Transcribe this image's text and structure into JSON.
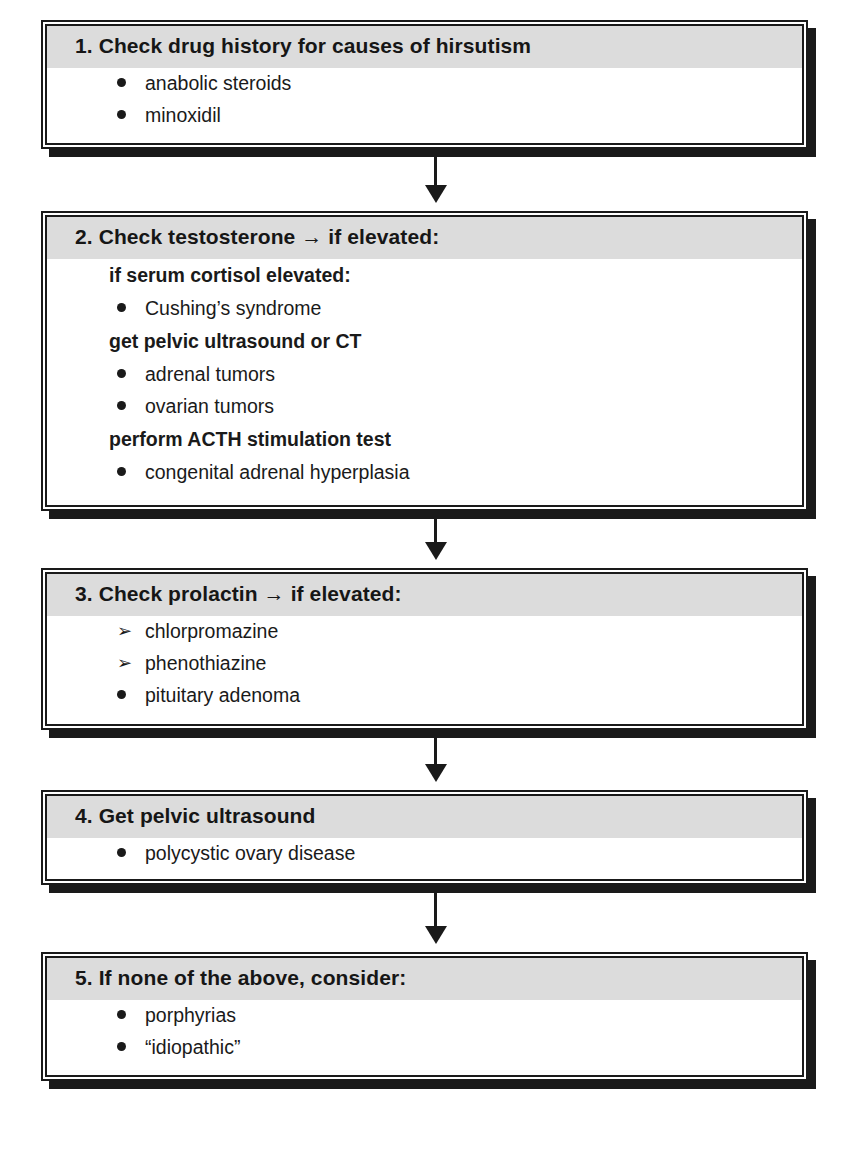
{
  "diagram": {
    "type": "flowchart",
    "steps": [
      {
        "title": "1. Check drug history for causes of hirsutism",
        "lines": [
          {
            "kind": "item",
            "marker": "bullet",
            "text": "anabolic steroids"
          },
          {
            "kind": "item",
            "marker": "bullet",
            "text": "minoxidil"
          }
        ]
      },
      {
        "title": "2. Check testosterone → if elevated:",
        "lines": [
          {
            "kind": "sub",
            "text": "if serum cortisol elevated:"
          },
          {
            "kind": "item",
            "marker": "bullet",
            "text": "Cushing’s syndrome"
          },
          {
            "kind": "sub",
            "text": "get pelvic ultrasound or CT"
          },
          {
            "kind": "item",
            "marker": "bullet",
            "text": "adrenal tumors"
          },
          {
            "kind": "item",
            "marker": "bullet",
            "text": "ovarian tumors"
          },
          {
            "kind": "sub",
            "text": "perform ACTH stimulation test"
          },
          {
            "kind": "item",
            "marker": "bullet",
            "text": "congenital adrenal hyperplasia"
          }
        ]
      },
      {
        "title": "3. Check prolactin → if elevated:",
        "lines": [
          {
            "kind": "item",
            "marker": "arrowhead",
            "text": "chlorpromazine"
          },
          {
            "kind": "item",
            "marker": "arrowhead",
            "text": "phenothiazine"
          },
          {
            "kind": "item",
            "marker": "bullet",
            "text": "pituitary adenoma"
          }
        ]
      },
      {
        "title": "4. Get pelvic ultrasound",
        "lines": [
          {
            "kind": "item",
            "marker": "bullet",
            "text": "polycystic ovary disease"
          }
        ]
      },
      {
        "title": "5. If none of the above, consider:",
        "lines": [
          {
            "kind": "item",
            "marker": "bullet",
            "text": "porphyrias"
          },
          {
            "kind": "item",
            "marker": "bullet",
            "text": "“idiopathic”"
          }
        ]
      }
    ],
    "connectors": [
      {
        "from": 1,
        "to": 2
      },
      {
        "from": 2,
        "to": 3
      },
      {
        "from": 3,
        "to": 4
      },
      {
        "from": 4,
        "to": 5
      }
    ],
    "colors": {
      "header_fill": "#dcdcdc",
      "border": "#1a1a1a",
      "background": "#ffffff"
    },
    "markers": {
      "bullet": "•",
      "arrowhead": "➢"
    }
  }
}
